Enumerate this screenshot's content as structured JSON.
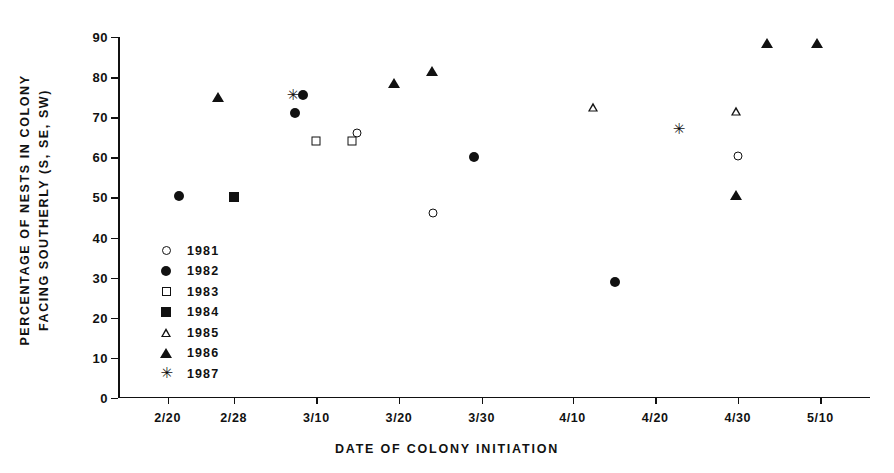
{
  "chart_data": {
    "type": "scatter",
    "title": "",
    "xlabel": "DATE OF COLONY INITIATION",
    "ylabel_line1": "PERCENTAGE OF NESTS IN COLONY",
    "ylabel_line2": "FACING SOUTHERLY (S, SE, SW)",
    "ylim": [
      0,
      90
    ],
    "yticks": [
      0,
      10,
      20,
      30,
      40,
      50,
      60,
      70,
      80,
      90
    ],
    "ytick_labels": [
      "0",
      "10",
      "20",
      "30",
      "40",
      "50",
      "60",
      "70",
      "80",
      "90"
    ],
    "xticks": [
      51,
      59,
      69,
      79,
      89,
      100,
      110,
      120,
      130
    ],
    "xtick_labels": [
      "2/20",
      "2/28",
      "3/10",
      "3/20",
      "3/30",
      "4/10",
      "4/20",
      "4/30",
      "5/10"
    ],
    "xlim": [
      45,
      136
    ],
    "grid": false,
    "legend_position": "inside lower-left",
    "series": [
      {
        "name": "1981",
        "marker": "circle-open",
        "points": [
          {
            "x": 73.9,
            "y": 66.0,
            "x_label": "3/14"
          },
          {
            "x": 83.1,
            "y": 46.0,
            "x_label": "3/24"
          },
          {
            "x": 120.0,
            "y": 60.3,
            "x_label": "4/30"
          }
        ]
      },
      {
        "name": "1982",
        "marker": "circle-filled",
        "points": [
          {
            "x": 52.4,
            "y": 50.3,
            "x_label": "2/21"
          },
          {
            "x": 66.4,
            "y": 71.0,
            "x_label": "3/07"
          },
          {
            "x": 67.4,
            "y": 75.5,
            "x_label": "3/08"
          },
          {
            "x": 88.1,
            "y": 60.0,
            "x_label": "3/29"
          },
          {
            "x": 105.1,
            "y": 29.0,
            "x_label": "4/15"
          }
        ]
      },
      {
        "name": "1983",
        "marker": "square-open",
        "points": [
          {
            "x": 69.0,
            "y": 64.0,
            "x_label": "3/10"
          },
          {
            "x": 73.3,
            "y": 64.0,
            "x_label": "3/14"
          },
          {
            "x": 59.0,
            "y": 50.0,
            "x_label": "2/28"
          }
        ]
      },
      {
        "name": "1984",
        "marker": "square-filled",
        "points": [
          {
            "x": 59.0,
            "y": 50.0,
            "x_label": "2/28"
          }
        ]
      },
      {
        "name": "1985",
        "marker": "triangle-open",
        "points": [
          {
            "x": 102.5,
            "y": 72.5,
            "x_label": "4/12"
          },
          {
            "x": 119.8,
            "y": 71.5,
            "x_label": "4/29"
          }
        ]
      },
      {
        "name": "1986",
        "marker": "triangle-filled",
        "points": [
          {
            "x": 57.1,
            "y": 75.0,
            "x_label": "2/26"
          },
          {
            "x": 78.4,
            "y": 78.5,
            "x_label": "3/19"
          },
          {
            "x": 83.0,
            "y": 81.5,
            "x_label": "3/24"
          },
          {
            "x": 119.8,
            "y": 50.5,
            "x_label": "4/29"
          },
          {
            "x": 129.6,
            "y": 88.5,
            "x_label": "5/09"
          },
          {
            "x": 123.5,
            "y": 88.5,
            "x_label": "5/03"
          }
        ]
      },
      {
        "name": "1987",
        "marker": "asterisk",
        "points": [
          {
            "x": 66.1,
            "y": 75.5,
            "x_label": "3/07"
          },
          {
            "x": 112.8,
            "y": 67.0,
            "x_label": "4/22"
          }
        ]
      }
    ]
  },
  "legend": {
    "items": [
      {
        "label": "1981",
        "marker": "circle-open"
      },
      {
        "label": "1982",
        "marker": "circle-filled"
      },
      {
        "label": "1983",
        "marker": "square-open"
      },
      {
        "label": "1984",
        "marker": "square-filled"
      },
      {
        "label": "1985",
        "marker": "triangle-open"
      },
      {
        "label": "1986",
        "marker": "triangle-filled"
      },
      {
        "label": "1987",
        "marker": "asterisk"
      }
    ]
  },
  "colors": {
    "ink": "#111111",
    "background": "#ffffff"
  }
}
